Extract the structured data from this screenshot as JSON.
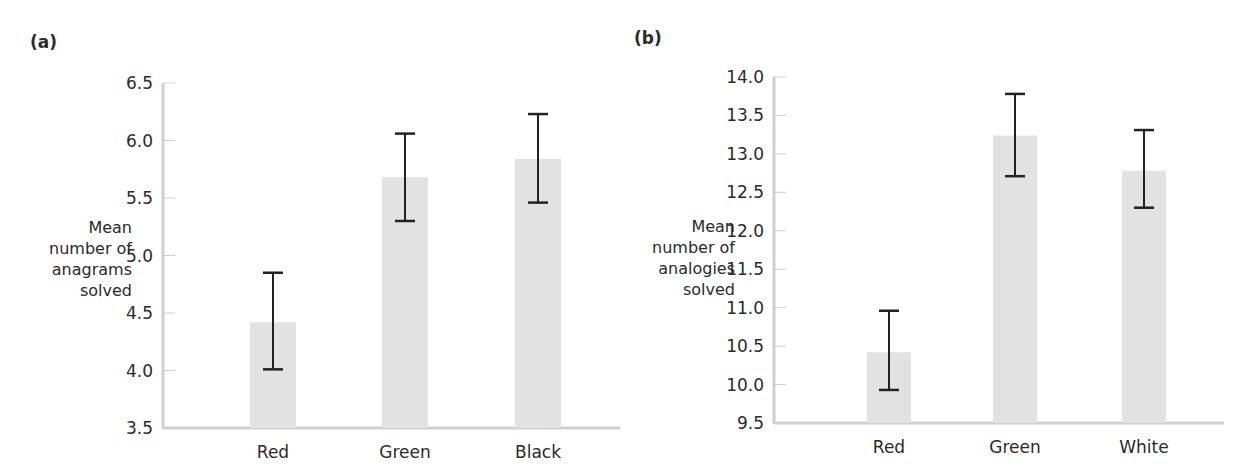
{
  "chart_data": [
    {
      "panel": "(a)",
      "type": "bar",
      "title": "",
      "xlabel": "",
      "ylabel": "Mean number of anagrams solved",
      "ylabel_lines": [
        "Mean",
        "number of",
        "anagrams",
        "solved"
      ],
      "categories": [
        "Red",
        "Green",
        "Black"
      ],
      "values": [
        4.42,
        5.68,
        5.84
      ],
      "error_low": [
        4.01,
        5.3,
        5.46
      ],
      "error_high": [
        4.85,
        6.06,
        6.23
      ],
      "ylim": [
        3.5,
        6.5
      ],
      "yticks": [
        "3.5",
        "4.0",
        "4.5",
        "5.0",
        "5.5",
        "6.0",
        "6.5"
      ],
      "grid": false,
      "legend": null,
      "bar_color": "#e2e2e2",
      "error_color": "#222222"
    },
    {
      "panel": "(b)",
      "type": "bar",
      "title": "",
      "xlabel": "",
      "ylabel": "Mean number of analogies solved",
      "ylabel_lines": [
        "Mean",
        "number of",
        "analogies",
        "solved"
      ],
      "categories": [
        "Red",
        "Green",
        "White"
      ],
      "values": [
        10.42,
        13.24,
        12.78
      ],
      "error_low": [
        9.93,
        12.71,
        12.3
      ],
      "error_high": [
        10.96,
        13.78,
        13.31
      ],
      "ylim": [
        9.5,
        14.0
      ],
      "yticks": [
        "9.5",
        "10.0",
        "10.5",
        "11.0",
        "11.5",
        "12.0",
        "12.5",
        "13.0",
        "13.5",
        "14.0"
      ],
      "grid": false,
      "legend": null,
      "bar_color": "#e2e2e2",
      "error_color": "#222222"
    }
  ],
  "panels": {
    "a": {
      "label": "(a)"
    },
    "b": {
      "label": "(b)"
    }
  }
}
